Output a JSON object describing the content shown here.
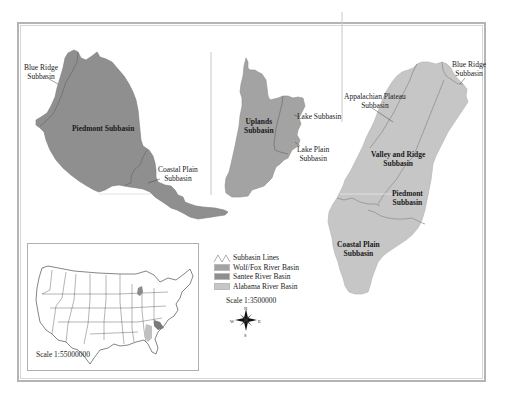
{
  "map": {
    "panels": [
      {
        "basin": "Santee River Basin",
        "subbasins": [
          {
            "name": "Blue Ridge Subbasin",
            "label_lines": [
              "Blue Ridge",
              "Subbasin"
            ]
          },
          {
            "name": "Piedmont Subbasin",
            "label_lines": [
              "Piedmont Subbasin"
            ]
          },
          {
            "name": "Coastal Plain Subbasin",
            "label_lines": [
              "Coastal Plain",
              "Subbasin"
            ]
          }
        ]
      },
      {
        "basin": "Wolf/Fox River Basin",
        "subbasins": [
          {
            "name": "Uplands Subbasin",
            "label_lines": [
              "Uplands",
              "Subbasin"
            ]
          },
          {
            "name": "Lake Subbasin",
            "label_lines": [
              "Lake Subbasin"
            ]
          },
          {
            "name": "Lake Plain Subbasin",
            "label_lines": [
              "Lake Plain",
              "Subbasin"
            ]
          }
        ]
      },
      {
        "basin": "Alabama River Basin",
        "subbasins": [
          {
            "name": "Blue Ridge Subbasin",
            "label_lines": [
              "Blue Ridge",
              "Subbasin"
            ]
          },
          {
            "name": "Appalachian Plateau Subbasin",
            "label_lines": [
              "Appalachian Plateau",
              "Subbasin"
            ]
          },
          {
            "name": "Valley and Ridge Subbasin",
            "label_lines": [
              "Valley and Ridge",
              "Subbasin"
            ]
          },
          {
            "name": "Piedmont Subbasin",
            "label_lines": [
              "Piedmont",
              "Subbasin"
            ]
          },
          {
            "name": "Coastal Plain Subbasin",
            "label_lines": [
              "Coastal Plain",
              "Subbasin"
            ]
          }
        ]
      }
    ],
    "legend": {
      "items": [
        {
          "label": "Subbasin Lines",
          "symbol": "line"
        },
        {
          "label": "Wolf/Fox River Basin",
          "color": "#a3a3a3"
        },
        {
          "label": "Santee River Basin",
          "color": "#8f8f8f"
        },
        {
          "label": "Alabama River Basin",
          "color": "#c6c6c6"
        }
      ],
      "scale": "Scale 1:3500000"
    },
    "compass": {
      "n": "N",
      "s": "S",
      "e": "E",
      "w": "W"
    },
    "inset": {
      "title": "Conterminous United States",
      "scale": "Scale 1:55000000"
    },
    "colors": {
      "santee": "#8f8f8f",
      "wolffox": "#a3a3a3",
      "alabama": "#c6c6c6",
      "subbasin_line": "#6e6e6e",
      "frame": "#b4b4b4"
    }
  }
}
